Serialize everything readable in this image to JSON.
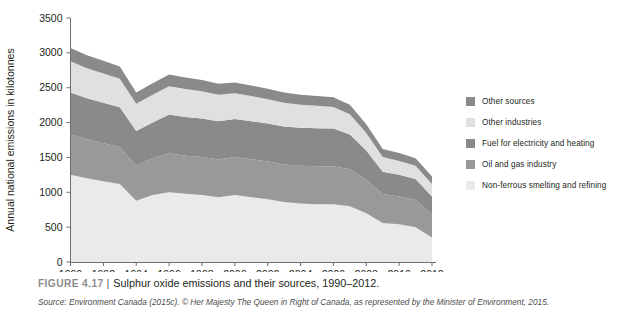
{
  "figure": {
    "number_label": "FIGURE 4.17",
    "separator": "|",
    "title": "Sulphur oxide emissions and their sources, 1990–2012.",
    "source": "Source: Environment Canada (2015c). © Her Majesty The Queen in Right of Canada, as represented by the Minister of Environment, 2015."
  },
  "colors": {
    "dark_gray": "#8a8a8a",
    "light_gray": "#e0e0e0",
    "axis": "#6e6e6e",
    "text": "#231f20",
    "caption_gray": "#8c8c8c"
  },
  "legend": {
    "position": "right",
    "items": [
      {
        "label": "Other sources",
        "color": "#8a8a8a",
        "swatch_name": "legend-swatch-other-sources"
      },
      {
        "label": "Other industries",
        "color": "#e0e0e0",
        "swatch_name": "legend-swatch-other-industries"
      },
      {
        "label": "Fuel for electricity and heating",
        "color": "#8a8a8a",
        "swatch_name": "legend-swatch-fuel-electricity-heating"
      },
      {
        "label": "Oil and gas industry",
        "color": "#999999",
        "swatch_name": "legend-swatch-oil-gas-industry"
      },
      {
        "label": "Non-ferrous smelting and refining",
        "color": "#eaeaea",
        "swatch_name": "legend-swatch-non-ferrous-smelting"
      }
    ]
  },
  "chart_data": {
    "type": "area",
    "stacked": true,
    "title": "Sulphur oxide emissions and their sources, 1990–2012",
    "xlabel": "",
    "ylabel": "Annual national emissions in kilotonnes",
    "xlim": [
      1990,
      2012
    ],
    "ylim": [
      0,
      3500
    ],
    "grid": false,
    "legend_position": "right",
    "x": [
      1990,
      1991,
      1992,
      1993,
      1994,
      1995,
      1996,
      1997,
      1998,
      1999,
      2000,
      2001,
      2002,
      2003,
      2004,
      2005,
      2006,
      2007,
      2008,
      2009,
      2010,
      2011,
      2012
    ],
    "x_ticks": [
      1990,
      1992,
      1994,
      1996,
      1998,
      2000,
      2002,
      2004,
      2006,
      2008,
      2010,
      2012
    ],
    "x_tick_labels": [
      "1990",
      "1992",
      "1994",
      "1996",
      "1998",
      "2000",
      "2002",
      "2004",
      "2006",
      "2008",
      "2010",
      "2012"
    ],
    "y_ticks": [
      0,
      500,
      1000,
      1500,
      2000,
      2500,
      3000,
      3500
    ],
    "y_tick_labels": [
      "0",
      "500",
      "1000",
      "1500",
      "2000",
      "2500",
      "3000",
      "3500"
    ],
    "series": [
      {
        "name": "Non-ferrous smelting and refining",
        "color": "#eaeaea",
        "stack_order": 1,
        "values": [
          1250,
          1200,
          1160,
          1120,
          880,
          960,
          1000,
          980,
          960,
          930,
          960,
          930,
          900,
          860,
          840,
          830,
          830,
          800,
          700,
          560,
          540,
          500,
          350
        ]
      },
      {
        "name": "Oil and gas industry",
        "color": "#999999",
        "stack_order": 2,
        "values": [
          580,
          560,
          545,
          530,
          500,
          530,
          555,
          545,
          545,
          540,
          545,
          545,
          540,
          540,
          540,
          545,
          545,
          530,
          480,
          415,
          400,
          390,
          330
        ]
      },
      {
        "name": "Fuel for electricity and heating",
        "color": "#8a8a8a",
        "stack_order": 3,
        "values": [
          600,
          590,
          580,
          570,
          500,
          510,
          560,
          555,
          555,
          550,
          545,
          545,
          545,
          545,
          545,
          545,
          540,
          500,
          420,
          320,
          310,
          300,
          260
        ]
      },
      {
        "name": "Other industries",
        "color": "#e0e0e0",
        "stack_order": 4,
        "values": [
          450,
          430,
          420,
          410,
          390,
          400,
          405,
          400,
          390,
          380,
          370,
          360,
          350,
          340,
          330,
          320,
          310,
          290,
          250,
          210,
          200,
          190,
          180
        ]
      },
      {
        "name": "Other sources",
        "color": "#8a8a8a",
        "stack_order": 5,
        "values": [
          190,
          185,
          180,
          175,
          160,
          165,
          170,
          165,
          160,
          158,
          155,
          152,
          150,
          148,
          145,
          142,
          140,
          135,
          125,
          115,
          112,
          110,
          105
        ]
      }
    ],
    "totals": [
      3070,
      2965,
      2885,
      2805,
      2430,
      2565,
      2690,
      2645,
      2610,
      2558,
      2575,
      2532,
      2485,
      2433,
      2400,
      2382,
      2365,
      2255,
      1975,
      1620,
      1562,
      1490,
      1225
    ]
  }
}
